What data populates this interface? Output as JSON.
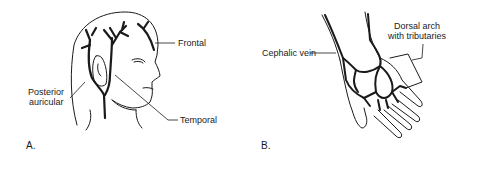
{
  "panels": [
    {
      "letter": "A.",
      "subject": "head-veins",
      "labels": {
        "frontal": "Frontal",
        "posterior_line1": "Posterior",
        "posterior_line2": "auricular",
        "temporal": "Temporal"
      }
    },
    {
      "letter": "B.",
      "subject": "hand-veins",
      "labels": {
        "cephalic": "Cephalic vein",
        "dorsal_line1": "Dorsal arch",
        "dorsal_line2": "with tributaries"
      }
    }
  ],
  "colors": {
    "ink": "#1a1a1a",
    "background": "#ffffff"
  }
}
